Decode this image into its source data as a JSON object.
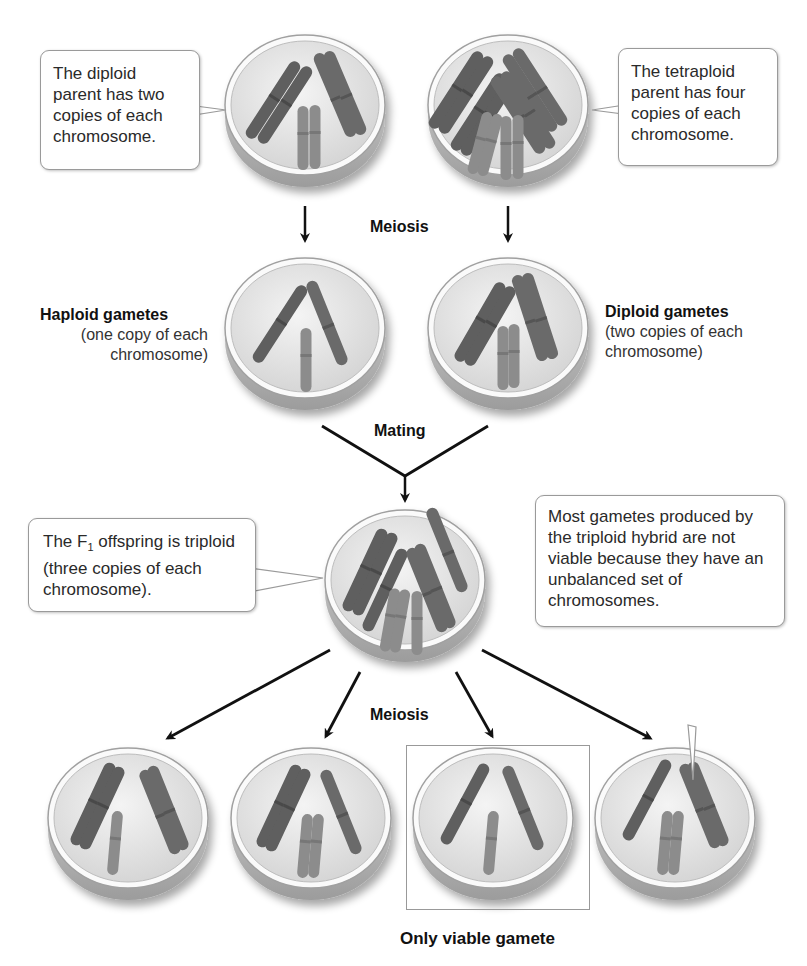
{
  "callouts": {
    "diploid_parent": "The diploid parent has two copies of each chromosome.",
    "tetraploid_parent": "The tetraploid parent has four copies of each chromosome.",
    "f1_offspring_prefix": "The F",
    "f1_offspring_subscript": "1",
    "f1_offspring_suffix": " offspring is triploid (three copies of each chromosome).",
    "triploid_gametes": "Most gametes produced by the triploid hybrid are not viable because they have an unbalanced set of chromosomes."
  },
  "labels": {
    "meiosis_top": "Meiosis",
    "mating": "Mating",
    "meiosis_bottom": "Meiosis",
    "haploid_title": "Haploid gametes",
    "haploid_desc": "(one copy of each chromosome)",
    "diploid_title": "Diploid gametes",
    "diploid_desc": "(two copies of each chromosome)",
    "only_viable": "Only viable gamete"
  },
  "cells": [
    {
      "id": "diploid-parent",
      "ploidy": 2
    },
    {
      "id": "tetraploid-parent",
      "ploidy": 4
    },
    {
      "id": "haploid-gamete",
      "ploidy": 1
    },
    {
      "id": "diploid-gamete",
      "ploidy": 2
    },
    {
      "id": "triploid-f1",
      "ploidy": 3
    },
    {
      "id": "gamete-1",
      "viable": false
    },
    {
      "id": "gamete-2",
      "viable": false
    },
    {
      "id": "gamete-3",
      "viable": true
    },
    {
      "id": "gamete-4",
      "viable": false
    }
  ],
  "colors": {
    "chromosome_dark": "#5a5a5a",
    "chromosome_light": "#8a8a8a",
    "cell_fill": "#e8e8e8",
    "arrow": "#111111"
  }
}
